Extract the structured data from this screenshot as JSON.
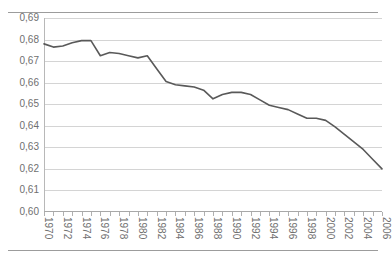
{
  "page": {
    "cropped_header_text": "' ' ' ' ' ' ' ' '"
  },
  "chart_data": {
    "type": "line",
    "title": "",
    "xlabel": "",
    "ylabel": "",
    "ylim": [
      0.6,
      0.69
    ],
    "ytick_step": 0.01,
    "grid": true,
    "legend": "none",
    "decimal_separator": ",",
    "line_color": "#595959",
    "grid_color": "#d4d4d4",
    "ytick_labels": [
      "0,69",
      "0,68",
      "0,67",
      "0,66",
      "0,65",
      "0,64",
      "0,63",
      "0,62",
      "0,61",
      "0,60"
    ],
    "ytick_values": [
      0.69,
      0.68,
      0.67,
      0.66,
      0.65,
      0.64,
      0.63,
      0.62,
      0.61,
      0.6
    ],
    "xtick_labels": [
      "1970",
      "1972",
      "1974",
      "1976",
      "1978",
      "1980",
      "1982",
      "1984",
      "1986",
      "1988",
      "1990",
      "1992",
      "1994",
      "1996",
      "1998",
      "2000",
      "2002",
      "2004",
      "2006"
    ],
    "x": [
      1970,
      1971,
      1972,
      1973,
      1974,
      1975,
      1976,
      1977,
      1978,
      1979,
      1980,
      1981,
      1982,
      1983,
      1984,
      1985,
      1986,
      1987,
      1988,
      1989,
      1990,
      1991,
      1992,
      1993,
      1994,
      1995,
      1996,
      1997,
      1998,
      1999,
      2000,
      2001,
      2002,
      2003,
      2004,
      2005,
      2006
    ],
    "values": [
      0.678,
      0.6765,
      0.677,
      0.6785,
      0.6795,
      0.6795,
      0.6725,
      0.674,
      0.6735,
      0.6725,
      0.6715,
      0.6725,
      0.6665,
      0.6605,
      0.659,
      0.6585,
      0.658,
      0.6565,
      0.6525,
      0.6545,
      0.6555,
      0.6555,
      0.6545,
      0.652,
      0.6495,
      0.6485,
      0.6475,
      0.6455,
      0.6435,
      0.6435,
      0.6425,
      0.6395,
      0.636,
      0.6325,
      0.629,
      0.6245,
      0.62
    ]
  }
}
